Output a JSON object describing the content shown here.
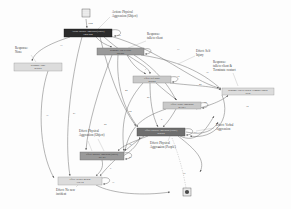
{
  "diagram": {
    "type": "process-model-graph",
    "palette": {
      "node_dark": "#2b2b2b",
      "node_dark_mid": "#6f6f6f",
      "node_mid": "#9a9a9a",
      "node_light": "#c9c9c9",
      "node_lighter": "#dcdcdc",
      "edge": "#6d6d6d",
      "text": "#3a3a3a",
      "background": "#ffffff"
    },
    "markers": {
      "start": {
        "name": "start-marker",
        "x": 86,
        "y": 13
      },
      "end": {
        "name": "end-marker",
        "x": 187,
        "y": 193
      }
    },
    "nodes": [
      {
        "id": "n1",
        "label": "Action: Physical Aggression (Object)",
        "inner": "1284\n1284",
        "x": 64,
        "y": 29,
        "w": 48,
        "h": 8,
        "fill": "#2b2b2b",
        "text_class": "nl-dark",
        "self_loop": true,
        "self_loop_count": "160"
      },
      {
        "id": "n2",
        "label": "Response: Talk to client",
        "inner": "556\n556",
        "x": 97,
        "y": 48,
        "w": 47,
        "h": 7,
        "fill": "#9a9a9a",
        "text_class": "nl-mid",
        "self_loop": true,
        "self_loop_count": "7"
      },
      {
        "id": "n3",
        "label": "Effect: Self Injury",
        "inner": "298\n298",
        "x": 133,
        "y": 76,
        "w": 38,
        "h": 7,
        "fill": "#c9c9c9",
        "text_class": "nl-light",
        "self_loop": true,
        "self_loop_count": "12"
      },
      {
        "id": "n4",
        "label": "Effect: Verbal Aggression",
        "inner": "271\n271",
        "x": 163,
        "y": 102,
        "w": 38,
        "h": 7,
        "fill": "#c9c9c9",
        "text_class": "nl-light",
        "self_loop": true,
        "self_loop_count": "18"
      },
      {
        "id": "n5",
        "label": "Effect: Physical Aggression (People)",
        "inner": "604\n604",
        "x": 137,
        "y": 128,
        "w": 48,
        "h": 8,
        "fill": "#6f6f6f",
        "text_class": "nl-dark",
        "self_loop": true,
        "self_loop_count": "73"
      },
      {
        "id": "n6",
        "label": "Effect: Physical Aggression (Object)",
        "inner": "381\n381",
        "x": 80,
        "y": 152,
        "w": 44,
        "h": 8,
        "fill": "#9a9a9a",
        "text_class": "nl-mid",
        "self_loop": true,
        "self_loop_count": "23"
      },
      {
        "id": "n7",
        "label": "Effect: No new incident",
        "inner": "332\n332",
        "x": 58,
        "y": 177,
        "w": 44,
        "h": 8,
        "fill": "#dcdcdc",
        "text_class": "nl-light",
        "self_loop": true,
        "self_loop_count": "31"
      },
      {
        "id": "n8",
        "label": "Response: None",
        "inner": "278\n278",
        "x": 14,
        "y": 63,
        "w": 48,
        "h": 8,
        "fill": "#dcdcdc",
        "text_class": "nl-light",
        "self_loop": false,
        "self_loop_count": ""
      },
      {
        "id": "n9",
        "label": "Response: Talk to client & Terminate contact",
        "inner": "96\n96",
        "x": 222,
        "y": 88,
        "w": 52,
        "h": 7,
        "fill": "#dcdcdc",
        "text_class": "nl-light",
        "self_loop": false,
        "self_loop_count": ""
      }
    ],
    "callouts": [
      {
        "name": "callout-action-physical-aggression-object",
        "text": "Action: Physical\nAggression (Object)",
        "x": 112,
        "y": 11,
        "align": "left"
      },
      {
        "name": "callout-response-talk-to-client",
        "text": "Response:\ntalk to client",
        "x": 147,
        "y": 33,
        "align": "left"
      },
      {
        "name": "callout-effect-self-injury",
        "text": "Effect: Self\nInjury",
        "x": 196,
        "y": 50,
        "align": "left"
      },
      {
        "name": "callout-response-talk-terminate",
        "text": "Response:\ntalk to client &\nTerminate contact",
        "x": 213,
        "y": 61,
        "align": "left"
      },
      {
        "name": "callout-response-none",
        "text": "Response:\nNone",
        "x": 15,
        "y": 47,
        "align": "left"
      },
      {
        "name": "callout-effect-verbal-aggression",
        "text": "Effect: Verbal\nAggression",
        "x": 216,
        "y": 124,
        "align": "left"
      },
      {
        "name": "callout-effect-physical-aggression-people",
        "text": "Effect: Physical\nAggression (People)",
        "x": 150,
        "y": 142,
        "align": "left"
      },
      {
        "name": "callout-effect-physical-aggression-object",
        "text": "Effect: Physical\nAggression (Object)",
        "x": 79,
        "y": 130,
        "align": "left"
      },
      {
        "name": "callout-effect-no-new-incident",
        "text": "Effect: No new\nincident",
        "x": 56,
        "y": 189,
        "align": "left"
      }
    ],
    "edge_counts": [
      {
        "v": "1284",
        "x": 88,
        "y": 22
      },
      {
        "v": "160",
        "x": 117,
        "y": 34
      },
      {
        "v": "33",
        "x": 60,
        "y": 44
      },
      {
        "v": "7",
        "x": 151,
        "y": 51
      },
      {
        "v": "17",
        "x": 177,
        "y": 48
      },
      {
        "v": "1",
        "x": 145,
        "y": 68
      },
      {
        "v": "12",
        "x": 177,
        "y": 75
      },
      {
        "v": "39",
        "x": 206,
        "y": 71
      },
      {
        "v": "42",
        "x": 199,
        "y": 83
      },
      {
        "v": "44",
        "x": 125,
        "y": 89
      },
      {
        "v": "18",
        "x": 204,
        "y": 101
      },
      {
        "v": "26",
        "x": 147,
        "y": 96
      },
      {
        "v": "54",
        "x": 129,
        "y": 110
      },
      {
        "v": "8",
        "x": 161,
        "y": 118
      },
      {
        "v": "73",
        "x": 194,
        "y": 131
      },
      {
        "v": "22",
        "x": 104,
        "y": 123
      },
      {
        "v": "35",
        "x": 129,
        "y": 143
      },
      {
        "v": "23",
        "x": 129,
        "y": 156
      },
      {
        "v": "49",
        "x": 158,
        "y": 146
      },
      {
        "v": "37",
        "x": 46,
        "y": 114
      },
      {
        "v": "21",
        "x": 73,
        "y": 112
      },
      {
        "v": "31",
        "x": 112,
        "y": 181
      },
      {
        "v": "9",
        "x": 110,
        "y": 167
      },
      {
        "v": "14",
        "x": 246,
        "y": 105
      },
      {
        "v": "16",
        "x": 183,
        "y": 172
      }
    ]
  }
}
